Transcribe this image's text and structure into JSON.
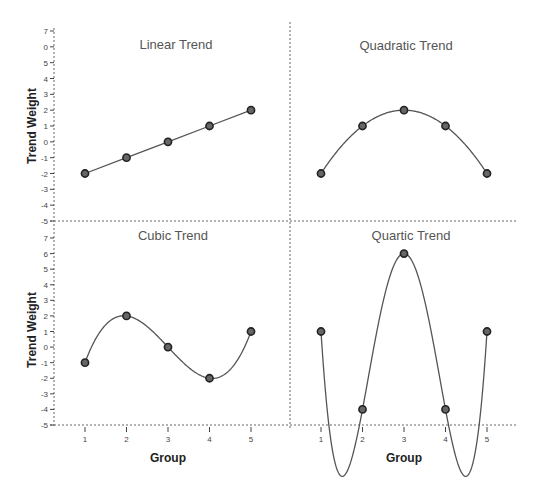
{
  "chart_data": [
    {
      "type": "line",
      "title": "Linear Trend",
      "xlabel": "",
      "ylabel": "Trend Weight",
      "x": [
        1,
        2,
        3,
        4,
        5
      ],
      "values": [
        -2,
        -1,
        0,
        1,
        2
      ],
      "ylim": [
        -5,
        7
      ],
      "yticks": [
        7,
        6,
        5,
        4,
        3,
        2,
        1,
        0,
        -1,
        -2,
        -3,
        -4,
        -5
      ],
      "ytick_labels": [
        "7",
        "0",
        "5",
        "4",
        "3",
        "2",
        "1",
        "0",
        "-1",
        "-2",
        "-3",
        "-4",
        "-5"
      ],
      "grid": false,
      "position": "top-left"
    },
    {
      "type": "line",
      "title": "Quadratic Trend",
      "xlabel": "",
      "ylabel": "",
      "x": [
        1,
        2,
        3,
        4,
        5
      ],
      "values": [
        -2,
        1,
        2,
        1,
        -2
      ],
      "ylim": [
        -5,
        7
      ],
      "grid": false,
      "position": "top-right"
    },
    {
      "type": "line",
      "title": "Cubic Trend",
      "xlabel": "Group",
      "ylabel": "Trend Weight",
      "x": [
        1,
        2,
        3,
        4,
        5
      ],
      "values": [
        -1,
        2,
        0,
        -2,
        1
      ],
      "ylim": [
        -5,
        7
      ],
      "yticks": [
        7,
        6,
        5,
        4,
        3,
        2,
        1,
        0,
        -1,
        -2,
        -3,
        -4,
        -5
      ],
      "ytick_labels": [
        "7",
        "6",
        "5",
        "4",
        "3",
        "2",
        "1",
        "0",
        "-1",
        "-2",
        "-3",
        "-4",
        "-5"
      ],
      "xticks": [
        "1",
        "2",
        "3",
        "4",
        "5"
      ],
      "grid": false,
      "position": "bottom-left"
    },
    {
      "type": "line",
      "title": "Quartic Trend",
      "xlabel": "Group",
      "ylabel": "",
      "x": [
        1,
        2,
        3,
        4,
        5
      ],
      "values": [
        1,
        -4,
        6,
        -4,
        1
      ],
      "ylim": [
        -5,
        7
      ],
      "xticks": [
        "1",
        "2",
        "3",
        "4",
        "5"
      ],
      "grid": false,
      "position": "bottom-right"
    }
  ],
  "labels": {
    "linear_title": "Linear Trend",
    "quadratic_title": "Quadratic Trend",
    "cubic_title": "Cubic Trend",
    "quartic_title": "Quartic Trend",
    "ylabel_top": "Trend Weight",
    "ylabel_bottom": "Trend Weight",
    "xlabel_left": "Group",
    "xlabel_right": "Group"
  },
  "colors": {
    "line": "#555555",
    "marker_fill": "#666666",
    "marker_stroke": "#222222",
    "axis": "#666666"
  }
}
